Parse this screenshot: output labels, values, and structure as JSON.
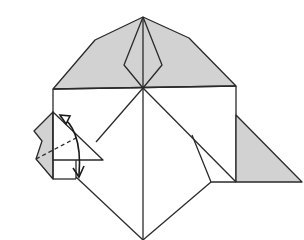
{
  "diagram": {
    "step_number": "18.",
    "colors": {
      "line": "#2a2a2a",
      "shade": "#d2d2d2",
      "paper": "#ffffff"
    },
    "elements": [
      "top-shaded-hexagon",
      "center-kite-fold",
      "right-shaded-triangle",
      "left-folded-flap",
      "valley-fold-dashed-line",
      "fold-arrow"
    ]
  }
}
